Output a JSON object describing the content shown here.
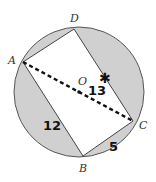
{
  "figure": {
    "circle": {
      "cx": 79,
      "cy": 92,
      "r": 65,
      "fill": "#d0d0d0",
      "stroke": "#555555"
    },
    "points": {
      "A": {
        "label": "A",
        "x": 23,
        "y": 62
      },
      "B": {
        "label": "B",
        "x": 83,
        "y": 156
      },
      "C": {
        "label": "C",
        "x": 133,
        "y": 121
      },
      "D": {
        "label": "D",
        "x": 74,
        "y": 29
      },
      "O": {
        "label": "O",
        "x": 79,
        "y": 92
      }
    },
    "segment_labels": {
      "AC": "13",
      "AB": "12",
      "BC": "5"
    },
    "star_marker": "✱",
    "quad_fill": "#ffffff"
  }
}
